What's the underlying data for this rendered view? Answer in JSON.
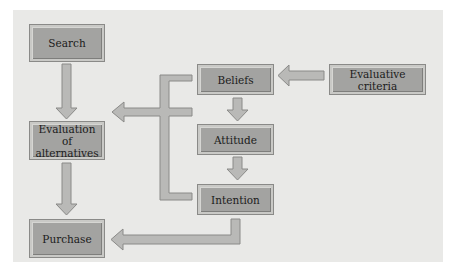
{
  "diagram": {
    "type": "consumer decision process flowchart",
    "colors": {
      "panel_background": "#e9e9e7",
      "box_fill": "#a3a3a1",
      "arrow_fill": "#b9b9b7",
      "arrow_stroke": "#8a8a88"
    },
    "nodes": {
      "search": "Search",
      "evaluation": "Evaluation of alternatives",
      "purchase": "Purchase",
      "beliefs": "Beliefs",
      "attitude": "Attitude",
      "intention": "Intention",
      "evaluative_criteria": "Evaluative criteria"
    },
    "edges": [
      {
        "from": "Search",
        "to": "Evaluation of alternatives"
      },
      {
        "from": "Evaluation of alternatives",
        "to": "Purchase"
      },
      {
        "from": "Evaluative criteria",
        "to": "Beliefs"
      },
      {
        "from": "Beliefs",
        "to": "Attitude"
      },
      {
        "from": "Attitude",
        "to": "Intention"
      },
      {
        "from": "Beliefs",
        "to": "Evaluation of alternatives"
      },
      {
        "from": "Attitude",
        "to": "Evaluation of alternatives"
      },
      {
        "from": "Intention",
        "to": "Evaluation of alternatives"
      },
      {
        "from": "Intention",
        "to": "Purchase"
      }
    ]
  }
}
